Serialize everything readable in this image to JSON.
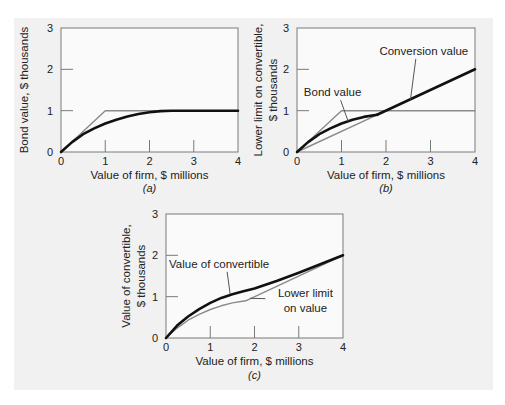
{
  "chart_data": [
    {
      "id": "a",
      "type": "line",
      "caption": "(a)",
      "caption_letter": "a",
      "xlabel": "Value of firm, $ millions",
      "ylabel": [
        "Bond value, $ thousands"
      ],
      "xlim": [
        0,
        4
      ],
      "ylim": [
        0,
        3
      ],
      "xticks": [
        "0",
        "1",
        "2",
        "3",
        "4"
      ],
      "yticks": [
        "0",
        "1",
        "2",
        "3"
      ],
      "series": [
        {
          "name": "Bond value upper bound",
          "style": "thin-gray",
          "x": [
            0,
            1,
            4
          ],
          "y": [
            0,
            1,
            1
          ]
        },
        {
          "name": "Bond value",
          "style": "thick-black",
          "x": [
            0,
            0.25,
            0.5,
            0.75,
            1,
            1.25,
            1.5,
            1.75,
            2,
            2.25,
            2.5,
            2.75,
            3,
            3.5,
            4
          ],
          "y": [
            0,
            0.24,
            0.43,
            0.57,
            0.69,
            0.78,
            0.86,
            0.92,
            0.96,
            0.99,
            1.0,
            1.0,
            1.0,
            1.0,
            1.0
          ]
        }
      ],
      "annotations": []
    },
    {
      "id": "b",
      "type": "line",
      "caption": "(b)",
      "caption_letter": "b",
      "xlabel": "Value of firm, $ millions",
      "ylabel": [
        "Lower limit on convertible,",
        "$ thousands"
      ],
      "xlim": [
        0,
        4
      ],
      "ylim": [
        0,
        3
      ],
      "xticks": [
        "0",
        "1",
        "2",
        "3",
        "4"
      ],
      "yticks": [
        "0",
        "1",
        "2",
        "3"
      ],
      "series": [
        {
          "name": "Bond value upper bound",
          "style": "thin-gray",
          "x": [
            0,
            1,
            4
          ],
          "y": [
            0,
            1,
            1
          ]
        },
        {
          "name": "Conversion value (below bond value)",
          "style": "thin-gray",
          "x": [
            0,
            1.8
          ],
          "y": [
            0,
            0.9
          ]
        },
        {
          "name": "Bond value",
          "style": "thick-black",
          "x": [
            0,
            0.25,
            0.5,
            0.75,
            1,
            1.25,
            1.5,
            1.8
          ],
          "y": [
            0,
            0.24,
            0.43,
            0.57,
            0.69,
            0.78,
            0.85,
            0.9
          ]
        },
        {
          "name": "Conversion value",
          "style": "thick-black",
          "x": [
            1.8,
            4
          ],
          "y": [
            0.9,
            2
          ]
        }
      ],
      "annotations": [
        {
          "text": "Conversion value",
          "label_at": [
            2.85,
            2.35
          ],
          "points_to": [
            2.55,
            1.27
          ]
        },
        {
          "text": "Bond value",
          "label_at": [
            0.8,
            1.35
          ],
          "points_to": [
            1.15,
            0.74
          ]
        }
      ]
    },
    {
      "id": "c",
      "type": "line",
      "caption": "(c)",
      "caption_letter": "c",
      "xlabel": "Value of firm, $ millions",
      "ylabel": [
        "Value of convertible,",
        "$ thousands"
      ],
      "xlim": [
        0,
        4
      ],
      "ylim": [
        0,
        3
      ],
      "xticks": [
        "0",
        "1",
        "2",
        "3",
        "4"
      ],
      "yticks": [
        "0",
        "1",
        "2",
        "3"
      ],
      "series": [
        {
          "name": "Lower limit on value",
          "style": "thin-gray",
          "x": [
            0,
            0.25,
            0.5,
            0.75,
            1,
            1.25,
            1.5,
            1.8,
            4
          ],
          "y": [
            0,
            0.24,
            0.43,
            0.57,
            0.69,
            0.78,
            0.85,
            0.9,
            2
          ]
        },
        {
          "name": "Value of convertible",
          "style": "thick-black",
          "x": [
            0,
            0.25,
            0.5,
            0.75,
            1,
            1.25,
            1.5,
            1.75,
            2,
            2.5,
            3,
            3.5,
            4
          ],
          "y": [
            0,
            0.3,
            0.52,
            0.7,
            0.85,
            0.97,
            1.06,
            1.13,
            1.2,
            1.38,
            1.58,
            1.79,
            2.0
          ]
        }
      ],
      "annotations": [
        {
          "text": "Value of convertible",
          "label_at": [
            1.2,
            1.7
          ],
          "points_to": [
            1.45,
            1.06
          ]
        },
        {
          "text": "Lower limit",
          "text2": "on value",
          "label_at": [
            3.15,
            1.0
          ],
          "points_to": [
            1.9,
            0.96
          ]
        }
      ]
    }
  ]
}
